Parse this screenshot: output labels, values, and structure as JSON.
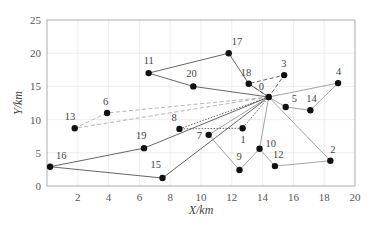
{
  "chart_data": {
    "type": "scatter",
    "title": "",
    "xlabel": "X/km",
    "ylabel": "Y/km",
    "xlim": [
      0,
      20
    ],
    "ylim": [
      0,
      25
    ],
    "xticks": [
      2,
      4,
      6,
      8,
      10,
      12,
      14,
      16,
      18,
      20
    ],
    "yticks": [
      0,
      5,
      10,
      15,
      20,
      25
    ],
    "grid": true,
    "legend": null,
    "nodes": [
      {
        "id": "0",
        "x": 14.4,
        "y": 13.4
      },
      {
        "id": "1",
        "x": 12.7,
        "y": 8.7
      },
      {
        "id": "2",
        "x": 18.4,
        "y": 3.8
      },
      {
        "id": "3",
        "x": 15.4,
        "y": 16.7
      },
      {
        "id": "4",
        "x": 18.9,
        "y": 15.5
      },
      {
        "id": "5",
        "x": 15.5,
        "y": 11.9
      },
      {
        "id": "6",
        "x": 3.9,
        "y": 11.0
      },
      {
        "id": "7",
        "x": 10.5,
        "y": 7.7
      },
      {
        "id": "8",
        "x": 8.6,
        "y": 8.6
      },
      {
        "id": "9",
        "x": 12.5,
        "y": 2.4
      },
      {
        "id": "10",
        "x": 13.8,
        "y": 5.6
      },
      {
        "id": "11",
        "x": 6.6,
        "y": 17.0
      },
      {
        "id": "12",
        "x": 14.8,
        "y": 3.0
      },
      {
        "id": "13",
        "x": 1.8,
        "y": 8.7
      },
      {
        "id": "14",
        "x": 17.1,
        "y": 11.4
      },
      {
        "id": "15",
        "x": 7.5,
        "y": 1.2
      },
      {
        "id": "16",
        "x": 0.2,
        "y": 2.9
      },
      {
        "id": "17",
        "x": 11.8,
        "y": 20.0
      },
      {
        "id": "18",
        "x": 13.1,
        "y": 15.4
      },
      {
        "id": "19",
        "x": 6.3,
        "y": 5.7
      },
      {
        "id": "20",
        "x": 9.5,
        "y": 15.0
      }
    ],
    "routes": [
      {
        "style": "solid",
        "color": "#555555",
        "path": [
          "0",
          "20",
          "11",
          "17",
          "18",
          "0"
        ]
      },
      {
        "style": "dashed",
        "color": "#555555",
        "path": [
          "0",
          "18",
          "3",
          "0"
        ]
      },
      {
        "style": "solid",
        "color": "#999999",
        "path": [
          "0",
          "4",
          "14",
          "5",
          "0"
        ]
      },
      {
        "style": "dashed",
        "color": "#aaaaaa",
        "path": [
          "0",
          "6",
          "13",
          "0"
        ]
      },
      {
        "style": "solid",
        "color": "#555555",
        "path": [
          "0",
          "19",
          "16",
          "15",
          "0"
        ]
      },
      {
        "style": "dotted",
        "color": "#555555",
        "path": [
          "0",
          "8",
          "1",
          "0"
        ]
      },
      {
        "style": "solid",
        "color": "#999999",
        "path": [
          "0",
          "7",
          "9",
          "10",
          "0"
        ]
      },
      {
        "style": "solid",
        "color": "#999999",
        "path": [
          "0",
          "2",
          "12",
          "10"
        ]
      }
    ]
  }
}
